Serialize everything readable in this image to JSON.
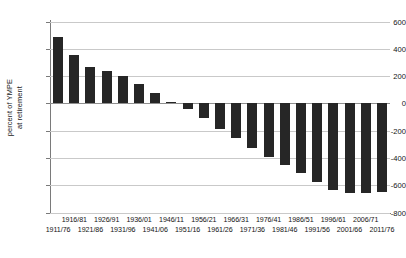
{
  "chart_data": {
    "type": "bar",
    "title": "",
    "subtitle": "",
    "xlabel": "",
    "ylabel": "percent of YMPE at retirement",
    "ylabel_line1": "percent of YMPE",
    "ylabel_line2": "at retirement",
    "ylim": [
      -800,
      600
    ],
    "ytick_values": [
      600,
      400,
      200,
      0,
      -200,
      -400,
      -600,
      -800
    ],
    "ytick_labels": [
      "600",
      "400",
      "200",
      "0",
      "-200",
      "-400",
      "-600",
      "-800"
    ],
    "grid": true,
    "grid_axis": "y",
    "legend": "none",
    "bar_color": "#262626",
    "grid_color": "#c9c9c9",
    "axis_color": "#7a7a7a",
    "categories": [
      "1911/76",
      "1916/81",
      "1921/86",
      "1926/91",
      "1931/96",
      "1936/01",
      "1941/06",
      "1946/11",
      "1951/16",
      "1956/21",
      "1961/26",
      "1966/31",
      "1971/36",
      "1976/41",
      "1981/46",
      "1986/51",
      "1991/56",
      "1996/61",
      "2001/66",
      "2006/71",
      "2011/76"
    ],
    "values": [
      490,
      355,
      265,
      235,
      200,
      140,
      75,
      10,
      -45,
      -110,
      -185,
      -255,
      -330,
      -395,
      -455,
      -510,
      -580,
      -635,
      -660,
      -655,
      -650
    ]
  },
  "xaxis_labels_row_top": [
    "1916/81",
    "1926/91",
    "1936/01",
    "1946/11",
    "1956/21",
    "1966/31",
    "1976/41",
    "1986/51",
    "1996/61",
    "2006/71"
  ],
  "xaxis_labels_row_bottom": [
    "1911/76",
    "1921/86",
    "1931/96",
    "1941/06",
    "1951/16",
    "1961/26",
    "1971/36",
    "1981/46",
    "1991/56",
    "2001/66",
    "2011/76"
  ]
}
